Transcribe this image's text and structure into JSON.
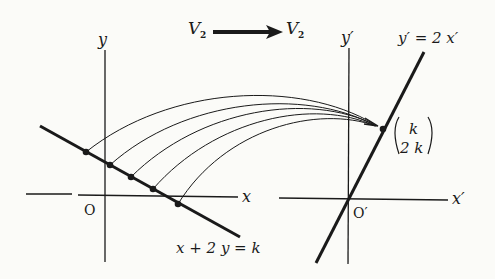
{
  "header": {
    "from_space": "V",
    "from_sub": "2",
    "to_space": "V",
    "to_sub": "2"
  },
  "left_plane": {
    "x_axis_label": "x",
    "y_axis_label": "y",
    "origin_label": "O",
    "line_equation": "x + 2 y = k",
    "points_count": 5
  },
  "right_plane": {
    "x_axis_label": "x′",
    "y_axis_label": "y′",
    "origin_label": "O′",
    "line_equation": "y′ = 2 x′",
    "image_point_top": "k",
    "image_point_bottom": "2 k"
  },
  "colors": {
    "ink": "#1a1a1a",
    "paper": "#fbfbf8"
  }
}
